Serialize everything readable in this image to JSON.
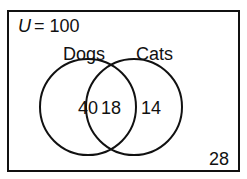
{
  "universe": {
    "label": "U",
    "equals": " = 100",
    "total": 100
  },
  "sets": [
    {
      "name": "Dogs",
      "only": 40
    },
    {
      "name": "Cats",
      "only": 14
    }
  ],
  "intersection": 18,
  "outside": 28,
  "labels": {
    "universe_var": "U",
    "universe_val": "= 100",
    "dogs": "Dogs",
    "cats": "Cats",
    "dogs_only": "40",
    "both": "18",
    "cats_only": "14",
    "neither": "28"
  },
  "colors": {
    "stroke": "#111111",
    "background": "#ffffff"
  }
}
